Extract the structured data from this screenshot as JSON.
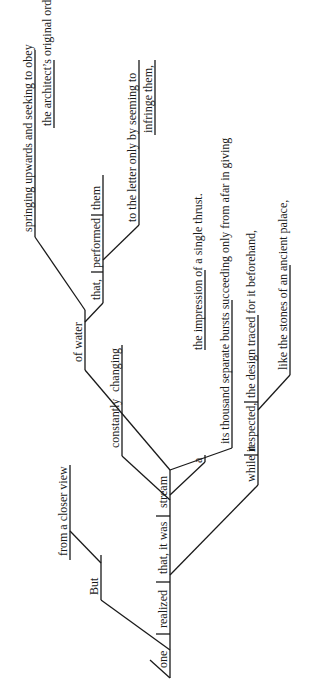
{
  "diagram": {
    "type": "sentence-diagram",
    "orientation": "rotated-90-ccw",
    "ink_color": "#1a1a1a",
    "background": "#ffffff",
    "words": {
      "but": "But",
      "from_closer_view": "from a closer view",
      "one": "one",
      "realized": "realized",
      "that_it_was": "that,  it was",
      "stream": "stream",
      "a": "a",
      "constantly": "constantly",
      "changing": "changing",
      "of_water": "of water",
      "that": "that,",
      "performed": "performed",
      "them": "them",
      "springing_line1": "springing upwards and seeking to obey",
      "springing_line2": "the architect’s original orders,",
      "letter_line1": "to the letter only by seeming to",
      "letter_line2": "infringe them,",
      "bursts_line1": "its thousand separate bursts succeeding only from afar in giving",
      "bursts_line2": "the impression of a single thrust.",
      "while_it": "while it",
      "respected": "respected,",
      "design": "the design traced for it beforehand,",
      "stones": "like the stones of an ancient palace,"
    }
  }
}
